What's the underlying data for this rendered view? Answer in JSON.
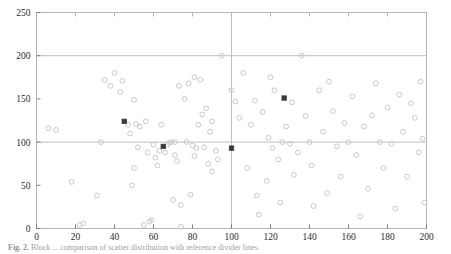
{
  "figure": {
    "caption_lead": "Fig. 2.",
    "caption_text": "Block ... comparison of scatter distribution with reference divider lines."
  },
  "chart_data": {
    "type": "scatter",
    "title": "",
    "xlabel": "",
    "ylabel": "",
    "xlim": [
      0,
      200
    ],
    "ylim": [
      0,
      250
    ],
    "xticks": [
      0,
      20,
      40,
      60,
      80,
      100,
      120,
      140,
      160,
      180,
      200
    ],
    "yticks": [
      0,
      50,
      100,
      150,
      200,
      250
    ],
    "xtick_labels": [
      "0",
      "20",
      "40",
      "60",
      "80",
      "100",
      "120",
      "140",
      "160",
      "180",
      "200"
    ],
    "ytick_labels": [
      "0",
      "50",
      "100",
      "150",
      "200",
      "250"
    ],
    "grid": false,
    "legend": null,
    "reference_lines": [
      {
        "name": "horizontal-divider-200",
        "orientation": "horizontal",
        "value": 200,
        "color": "#bfbfbf"
      },
      {
        "name": "horizontal-divider-100",
        "orientation": "horizontal",
        "value": 100,
        "color": "#bfbfbf"
      },
      {
        "name": "vertical-divider-100",
        "orientation": "vertical",
        "value": 100,
        "color": "#bfbfbf"
      }
    ],
    "series": [
      {
        "name": "open-markers",
        "marker": "open-circle",
        "color": "#c9c9c9",
        "points": [
          [
            6,
            116
          ],
          [
            10,
            114
          ],
          [
            18,
            54
          ],
          [
            22,
            4
          ],
          [
            24,
            6
          ],
          [
            31,
            38
          ],
          [
            33,
            100
          ],
          [
            35,
            172
          ],
          [
            38,
            165
          ],
          [
            40,
            180
          ],
          [
            43,
            158
          ],
          [
            44,
            171
          ],
          [
            47,
            120
          ],
          [
            48,
            110
          ],
          [
            49,
            50
          ],
          [
            50,
            149
          ],
          [
            50,
            70
          ],
          [
            51,
            121
          ],
          [
            52,
            94
          ],
          [
            53,
            118
          ],
          [
            55,
            4
          ],
          [
            56,
            124
          ],
          [
            57,
            88
          ],
          [
            58,
            8
          ],
          [
            59,
            10
          ],
          [
            60,
            97
          ],
          [
            61,
            82
          ],
          [
            62,
            73
          ],
          [
            63,
            90
          ],
          [
            64,
            120
          ],
          [
            66,
            88
          ],
          [
            67,
            97
          ],
          [
            68,
            99
          ],
          [
            69,
            100
          ],
          [
            70,
            33
          ],
          [
            71,
            85
          ],
          [
            71,
            100
          ],
          [
            72,
            78
          ],
          [
            73,
            165
          ],
          [
            74,
            27
          ],
          [
            74,
            2
          ],
          [
            76,
            150
          ],
          [
            77,
            100
          ],
          [
            78,
            168
          ],
          [
            79,
            39
          ],
          [
            80,
            96
          ],
          [
            81,
            175
          ],
          [
            81,
            84
          ],
          [
            82,
            93
          ],
          [
            83,
            120
          ],
          [
            84,
            172
          ],
          [
            85,
            132
          ],
          [
            86,
            94
          ],
          [
            87,
            139
          ],
          [
            88,
            75
          ],
          [
            89,
            112
          ],
          [
            90,
            66
          ],
          [
            90,
            124
          ],
          [
            92,
            90
          ],
          [
            93,
            80
          ],
          [
            95,
            200
          ],
          [
            100,
            160
          ],
          [
            102,
            147
          ],
          [
            104,
            128
          ],
          [
            106,
            180
          ],
          [
            108,
            70
          ],
          [
            110,
            120
          ],
          [
            112,
            148
          ],
          [
            113,
            38
          ],
          [
            114,
            16
          ],
          [
            116,
            135
          ],
          [
            118,
            55
          ],
          [
            119,
            105
          ],
          [
            120,
            175
          ],
          [
            121,
            93
          ],
          [
            122,
            160
          ],
          [
            124,
            80
          ],
          [
            125,
            30
          ],
          [
            126,
            100
          ],
          [
            128,
            118
          ],
          [
            130,
            98
          ],
          [
            131,
            146
          ],
          [
            132,
            62
          ],
          [
            134,
            88
          ],
          [
            136,
            200
          ],
          [
            138,
            130
          ],
          [
            140,
            100
          ],
          [
            141,
            73
          ],
          [
            142,
            26
          ],
          [
            145,
            160
          ],
          [
            147,
            112
          ],
          [
            149,
            41
          ],
          [
            150,
            170
          ],
          [
            152,
            136
          ],
          [
            154,
            95
          ],
          [
            156,
            60
          ],
          [
            158,
            122
          ],
          [
            160,
            100
          ],
          [
            162,
            153
          ],
          [
            164,
            85
          ],
          [
            166,
            14
          ],
          [
            168,
            118
          ],
          [
            170,
            46
          ],
          [
            172,
            131
          ],
          [
            174,
            168
          ],
          [
            176,
            100
          ],
          [
            178,
            70
          ],
          [
            180,
            140
          ],
          [
            182,
            98
          ],
          [
            184,
            23
          ],
          [
            186,
            155
          ],
          [
            188,
            112
          ],
          [
            190,
            60
          ],
          [
            192,
            145
          ],
          [
            194,
            128
          ],
          [
            196,
            88
          ],
          [
            197,
            170
          ],
          [
            198,
            104
          ],
          [
            199,
            30
          ]
        ]
      },
      {
        "name": "filled-markers",
        "marker": "filled-square",
        "color": "#3a3a3a",
        "points": [
          [
            45,
            124
          ],
          [
            65,
            95
          ],
          [
            100,
            93
          ],
          [
            127,
            151
          ]
        ]
      }
    ]
  }
}
